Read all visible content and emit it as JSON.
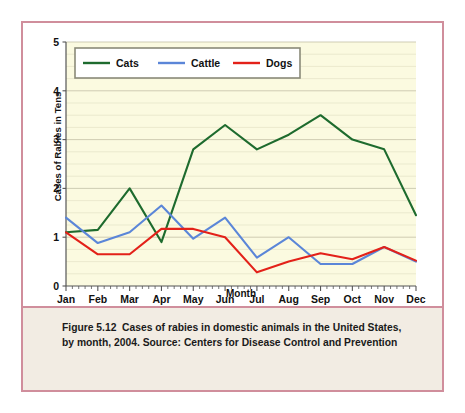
{
  "figure": {
    "caption_label": "Figure 5.12",
    "caption_body": "Cases of rabies in domestic animals in the United States, by month, 2004. Source: Centers for Disease Control and Prevention",
    "copyright": "© Infobase Publishing"
  },
  "colors": {
    "border": "#d08e9c",
    "plot_background": "#fbfae0",
    "caption_background": "#f2ece3",
    "cats": "#1e6b2e",
    "cattle": "#5b86d8",
    "dogs": "#e32119",
    "gridline": "#c9c7ae",
    "axis": "#555555"
  },
  "chart_data": {
    "type": "line",
    "title": "",
    "xlabel": "Month",
    "ylabel": "Cases of Rabies in Tens",
    "categories": [
      "Jan",
      "Feb",
      "Mar",
      "Apr",
      "May",
      "Jun",
      "Jul",
      "Aug",
      "Sep",
      "Oct",
      "Nov",
      "Dec"
    ],
    "ylim": [
      0,
      5
    ],
    "yticks": [
      0,
      1,
      2,
      3,
      4,
      5
    ],
    "yticklabels": [
      "0",
      "1",
      "2",
      "3",
      "4",
      "5"
    ],
    "minor_gridlines": true,
    "grid": true,
    "legend_position": "top-left",
    "series": [
      {
        "name": "Cats",
        "color": "#1e6b2e",
        "values": [
          1.1,
          1.15,
          2.0,
          0.9,
          2.8,
          3.3,
          2.8,
          3.1,
          3.5,
          3.0,
          2.8,
          1.45
        ]
      },
      {
        "name": "Cattle",
        "color": "#5b86d8",
        "values": [
          1.4,
          0.88,
          1.1,
          1.65,
          0.97,
          1.4,
          0.58,
          1.0,
          0.45,
          0.45,
          0.8,
          0.5
        ]
      },
      {
        "name": "Dogs",
        "color": "#e32119",
        "values": [
          1.1,
          0.65,
          0.65,
          1.17,
          1.17,
          1.0,
          0.28,
          0.5,
          0.67,
          0.55,
          0.8,
          0.52
        ]
      }
    ]
  }
}
